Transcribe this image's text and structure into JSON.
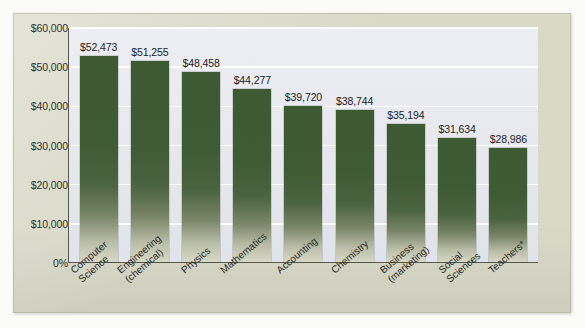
{
  "chart_data": {
    "type": "bar",
    "title": "",
    "subtitle": "",
    "xlabel": "",
    "ylabel": "",
    "ylim": [
      0,
      60000
    ],
    "grid": true,
    "legend": "none",
    "categories": [
      "Computer Science",
      "Engineering (chemical)",
      "Physics",
      "Mathematics",
      "Accounting",
      "Chemistry",
      "Business (marketing)",
      "Social Sciences",
      "Teachers*"
    ],
    "category_lines": [
      [
        "Computer",
        "Science"
      ],
      [
        "Engineering",
        "(chemical)"
      ],
      [
        "Physics"
      ],
      [
        "Mathematics"
      ],
      [
        "Accounting"
      ],
      [
        "Chemistry"
      ],
      [
        "Business",
        "(marketing)"
      ],
      [
        "Social",
        "Sciences"
      ],
      [
        "Teachers*"
      ]
    ],
    "values": [
      52473,
      51255,
      48458,
      44277,
      39720,
      38744,
      35194,
      31634,
      28986
    ],
    "value_labels": [
      "$52,473",
      "$51,255",
      "$48,458",
      "$44,277",
      "$39,720",
      "$38,744",
      "$35,194",
      "$31,634",
      "$28,986"
    ],
    "y_ticks": [
      0,
      10000,
      20000,
      30000,
      40000,
      50000,
      60000
    ],
    "y_tick_labels": [
      "0%",
      "$10,000",
      "$20,000",
      "$30,000",
      "$40,000",
      "$50,000",
      "$60,000"
    ]
  },
  "colors": {
    "bar_top": "#3d5a33",
    "bar_bottom": "#d7d8c6",
    "frame_background": "#d9d9c8",
    "plot_background": "#e6e8ee",
    "gridline": "#ffffff",
    "axis": "#59594f",
    "text": "#27271f"
  }
}
